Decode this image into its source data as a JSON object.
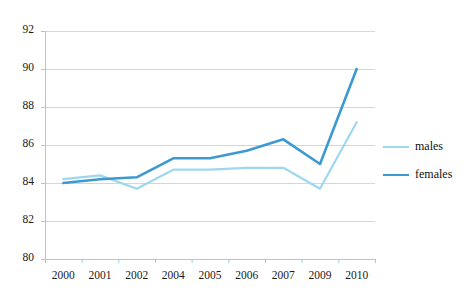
{
  "chart_data": {
    "type": "line",
    "title": "",
    "subtitle": "",
    "xlabel": "",
    "ylabel": "",
    "categories": [
      "2000",
      "2001",
      "2002",
      "2004",
      "2005",
      "2006",
      "2007",
      "2009",
      "2010"
    ],
    "series": [
      {
        "name": "males",
        "color": "#9ed7ee",
        "stroke_width": 2.2,
        "values": [
          84.2,
          84.4,
          83.7,
          84.7,
          84.7,
          84.8,
          84.8,
          83.7,
          87.2
        ]
      },
      {
        "name": "females",
        "color": "#3c9ad0",
        "stroke_width": 2.6,
        "values": [
          84.0,
          84.2,
          84.3,
          85.3,
          85.3,
          85.7,
          86.3,
          85.0,
          90.0
        ]
      }
    ],
    "ylim": [
      80,
      92
    ],
    "yticks": [
      80,
      82,
      84,
      86,
      88,
      90,
      92
    ],
    "ytick_labels": [
      "80",
      "82",
      "84",
      "86",
      "88",
      "90",
      "92"
    ],
    "grid": true,
    "grid_color": "#bcdff0",
    "axis_color": "#9ccfe6",
    "legend_position": "right",
    "legend_entries": [
      "males",
      "females"
    ],
    "background": "#ffffff"
  },
  "plot": {
    "left": 45,
    "right": 375,
    "top": 31,
    "bottom": 259
  }
}
